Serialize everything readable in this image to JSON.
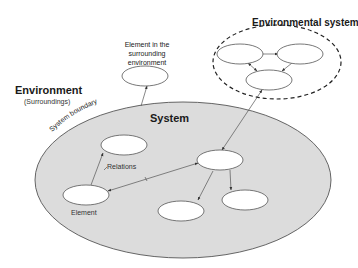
{
  "diagram": {
    "labels": {
      "environment": "Environment",
      "surroundings": "(Surroundings)",
      "system": "System",
      "environmental_system": "Environmental system",
      "element_in_surrounding": "Element in the surrounding environment",
      "relations": "Relations",
      "element": "Element",
      "system_boundary": "System boundary"
    },
    "colors": {
      "system_fill": "#dcdcdc",
      "stroke": "#555555",
      "node_fill": "#ffffff",
      "dashed_boundary": "#222222"
    },
    "system_nodes": [
      {
        "id": "upper-left",
        "cx": 141,
        "cy": 116
      },
      {
        "id": "element",
        "cx": 86,
        "cy": 195
      },
      {
        "id": "center",
        "cx": 220,
        "cy": 160
      },
      {
        "id": "bottom-center",
        "cx": 178,
        "cy": 211
      },
      {
        "id": "bottom-right",
        "cx": 245,
        "cy": 199
      }
    ],
    "environment_node": {
      "id": "surrounding",
      "cx": 147,
      "cy": 76
    },
    "environmental_system_nodes": [
      {
        "id": "env-left",
        "cx": 240,
        "cy": 54
      },
      {
        "id": "env-right",
        "cx": 300,
        "cy": 54
      },
      {
        "id": "env-bottom",
        "cx": 269,
        "cy": 80
      }
    ]
  }
}
